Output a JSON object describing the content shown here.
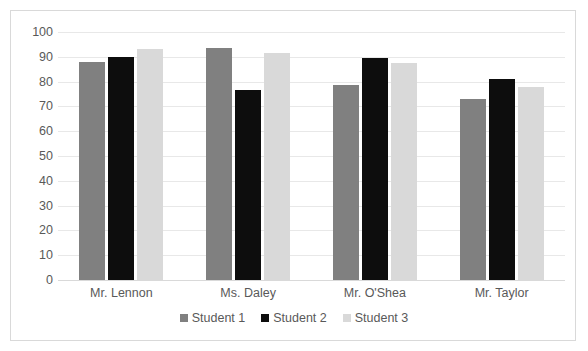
{
  "chart_data": {
    "type": "bar",
    "title": "",
    "subtitle": "",
    "xlabel": "",
    "ylabel": "",
    "categories": [
      "Mr. Lennon",
      "Ms. Daley",
      "Mr. O'Shea",
      "Mr. Taylor"
    ],
    "series": [
      {
        "name": "Student 1",
        "color": "#808080",
        "values": [
          88,
          93.5,
          78.5,
          73
        ]
      },
      {
        "name": "Student 2",
        "color": "#0d0d0d",
        "values": [
          90,
          76.5,
          89.5,
          81
        ]
      },
      {
        "name": "Student 3",
        "color": "#d9d9d9",
        "values": [
          93,
          91.5,
          87.5,
          78
        ]
      }
    ],
    "ylim": [
      0,
      100
    ],
    "yticks": [
      100,
      90,
      80,
      70,
      60,
      50,
      40,
      30,
      20,
      10,
      0
    ],
    "grid": true,
    "grid_axis": "y",
    "legend_position": "bottom",
    "plot_background": "#ffffff",
    "gridline_color": "#e8e8e8",
    "axis_text_color": "#595959",
    "border_color": "#d9d9d9"
  }
}
